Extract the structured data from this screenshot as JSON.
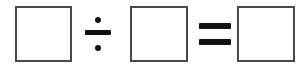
{
  "page": {
    "kind": "math-equation-template",
    "expression": "□ ÷ □ = □",
    "background_color": "#ffffff",
    "width": 307,
    "height": 73
  },
  "equation": {
    "label": "division equation with blank answer boxes",
    "ink_color": "#111111",
    "box_border_color": "#4a4a4a",
    "box_fill_color": "#ffffff",
    "box_border_width": 2,
    "slots": [
      {
        "name": "dividend-box",
        "value": "",
        "placeholder": "",
        "x": 15,
        "y": 6,
        "width": 57,
        "height": 56
      },
      {
        "name": "divisor-box",
        "value": "",
        "placeholder": "",
        "x": 130,
        "y": 6,
        "width": 58,
        "height": 56
      },
      {
        "name": "quotient-box",
        "value": "",
        "placeholder": "",
        "x": 237,
        "y": 6,
        "width": 58,
        "height": 56
      }
    ],
    "operators": [
      {
        "name": "division-operator",
        "symbol": "÷",
        "x": 85,
        "y": 17,
        "width": 26,
        "height": 34
      },
      {
        "name": "equals-operator",
        "symbol": "=",
        "x": 199,
        "y": 23,
        "width": 32,
        "height": 22
      }
    ]
  }
}
